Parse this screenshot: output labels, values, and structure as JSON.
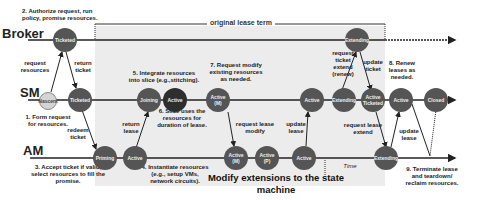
{
  "roles": {
    "broker": "Broker",
    "sm": "SM",
    "am": "AM"
  },
  "term_label": "original lease term",
  "time_label": "Time",
  "caption": "Modify extensions to the state machine",
  "steps": {
    "s1": "1. Form request\nfor resources.",
    "s2": "2. Authorize request, run\npolicy, promise resources.",
    "s3": "3. Accept ticket if valid,\nselect resources to fill the\npromise.",
    "s4": "4. Instantiate resources\n(e.g., setup VMs,\nnetwork circuits).",
    "s5": "5. Integrate resources\ninto slice (e.g.,stitching).",
    "s6": "6. Slice uses the\nresources for\nduration of lease.",
    "s7": "7. Request modify\nexisting resources\nas needed.",
    "s8": "8. Renew\nleases as\nneeded.",
    "s9": "9. Terminate lease\nand teardown/\nreclaim resources."
  },
  "arrows": {
    "request_resources": "request\nresources",
    "return_ticket": "return\nticket",
    "redeem_ticket": "redeem\nticket",
    "return_lease": "return\nlease",
    "request_lease_modify": "request lease\nmodify",
    "update_lease_1": "update\nlease",
    "request_ticket_extend": "request\nticket\nextend\n(renew)",
    "update_ticket": "update\nticket",
    "request_lease_extend": "request lease\nextend",
    "update_lease_2": "update\nlease"
  },
  "nodes": {
    "broker_ticketed": "Ticketed",
    "broker_extending": "Extending",
    "sm_nascent": "Nascent",
    "sm_ticketed": "Ticketed",
    "sm_joining": "Joining",
    "sm_active": "Active",
    "sm_active_m": "Active\n(M)",
    "sm_active2": "Active",
    "sm_extending": "Extending",
    "sm_active_ticketed": "Active\nTicketed",
    "sm_active3": "Active",
    "sm_closed": "Closed",
    "am_priming": "Priming",
    "am_active": "Active",
    "am_active_m": "Active\n(M)",
    "am_active_p": "Active\n(P)",
    "am_active2": "Active",
    "am_extending": "Extending"
  },
  "colors": {
    "node": "#555555",
    "node_dark": "#2e2e2e",
    "node_light": "#d4d4d4",
    "shade": "#ececec",
    "line": "#222222"
  }
}
